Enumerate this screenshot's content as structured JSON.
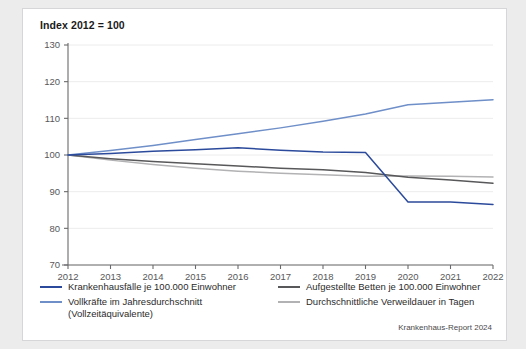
{
  "card": {
    "title": "Index 2012 = 100",
    "source_note": "Krankenhaus-Report 2024"
  },
  "legend": {
    "left": [
      {
        "label": "Krankenhausfälle je 100.000 Einwohner",
        "color": "#2b4a9b"
      },
      {
        "label": "Vollkräfte im Jahresdurchschnitt\n(Vollzeitäquivalente)",
        "color": "#6f8fc9"
      }
    ],
    "right": [
      {
        "label": "Aufgestellte Betten je 100.000 Einwohner",
        "color": "#58585a"
      },
      {
        "label": "Durchschnittliche Verweildauer in Tagen",
        "color": "#b2b2b4"
      }
    ]
  },
  "chart_data": {
    "type": "line",
    "title": "Index 2012 = 100",
    "xlabel": "",
    "ylabel": "",
    "x": [
      2012,
      2013,
      2014,
      2015,
      2016,
      2017,
      2018,
      2019,
      2020,
      2021,
      2022
    ],
    "categories": [
      "2012",
      "2013",
      "2014",
      "2015",
      "2016",
      "2017",
      "2018",
      "2019",
      "2020",
      "2021",
      "2022"
    ],
    "ylim": [
      70,
      130
    ],
    "yticks": [
      70,
      80,
      90,
      100,
      110,
      120,
      130
    ],
    "grid": true,
    "legend_position": "bottom",
    "series": [
      {
        "name": "Krankenhausfälle je 100.000 Einwohner",
        "color": "#2b4a9b",
        "values": [
          100,
          100.4,
          101.0,
          101.4,
          102.0,
          101.3,
          100.8,
          100.7,
          87.2,
          87.2,
          86.5
        ]
      },
      {
        "name": "Vollkräfte im Jahresdurchschnitt (Vollzeitäquivalente)",
        "color": "#6f8fc9",
        "values": [
          100,
          101.2,
          102.6,
          104.2,
          105.8,
          107.4,
          109.2,
          111.2,
          113.7,
          114.4,
          115.1
        ]
      },
      {
        "name": "Aufgestellte Betten je 100.000 Einwohner",
        "color": "#58585a",
        "values": [
          100,
          99.0,
          98.2,
          97.6,
          97.0,
          96.4,
          96.0,
          95.2,
          93.9,
          93.2,
          92.3
        ]
      },
      {
        "name": "Durchschnittliche Verweildauer in Tagen",
        "color": "#b2b2b4",
        "values": [
          100,
          98.6,
          97.4,
          96.4,
          95.6,
          95.0,
          94.6,
          94.2,
          94.3,
          94.2,
          94.0
        ]
      }
    ]
  }
}
